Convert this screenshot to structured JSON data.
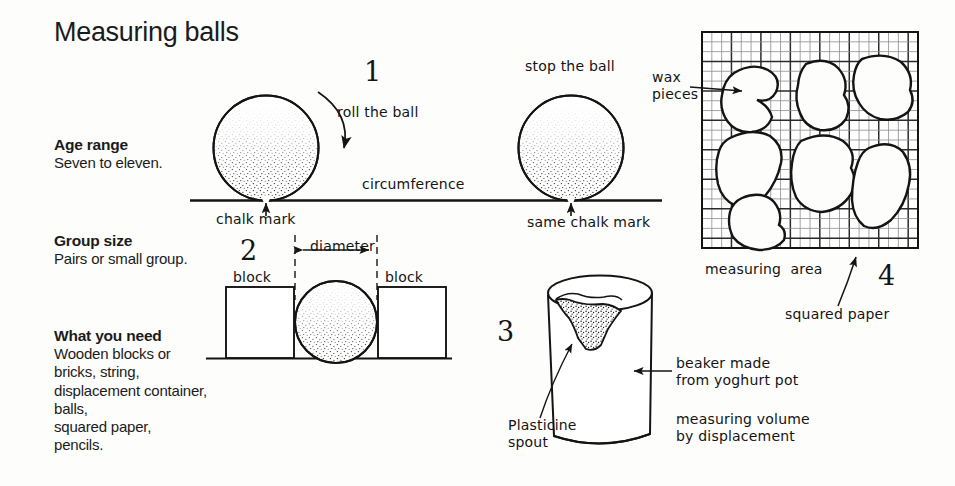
{
  "page": {
    "title": "Measuring balls",
    "background_color": "#fdfdfc",
    "ink_color": "#141414"
  },
  "sidebar": {
    "sections": [
      {
        "heading": "Age range",
        "body": "Seven to eleven."
      },
      {
        "heading": "Group size",
        "body": "Pairs or small group."
      },
      {
        "heading": "What you need",
        "body": "Wooden blocks or\nbricks, string,\ndisplacement container,\nballs,\nsquared paper,\npencils."
      }
    ]
  },
  "figures": {
    "step1": {
      "number": "1",
      "roll_label": "roll the ball",
      "stop_label": "stop the ball",
      "circumference_label": "circumference",
      "chalk_mark_label": "chalk mark",
      "same_chalk_mark_label": "same chalk mark"
    },
    "step2": {
      "number": "2",
      "block_left_label": "block",
      "block_right_label": "block",
      "diameter_label": "diameter"
    },
    "step3": {
      "number": "3",
      "plasticine_label": "Plasticine\nspout",
      "beaker_label": "beaker made\nfrom yoghurt pot",
      "displacement_label": "measuring volume\nby displacement"
    },
    "step4": {
      "number": "4",
      "wax_pieces_label": "wax\npieces",
      "measuring_area_label": "measuring  area",
      "squared_paper_label": "squared paper",
      "grid": {
        "columns": 22,
        "rows": 22,
        "heavy_every": 3
      }
    }
  }
}
